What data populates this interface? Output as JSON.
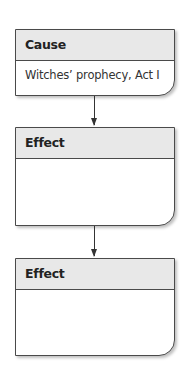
{
  "diagram": {
    "type": "cause-effect flowchart",
    "boxes": [
      {
        "header": "Cause",
        "body": "Witches’ prophecy, Act I"
      },
      {
        "header": "Effect",
        "body": ""
      },
      {
        "header": "Effect",
        "body": ""
      }
    ],
    "connectors": [
      {
        "from": 0,
        "to": 1,
        "style": "arrow-down"
      },
      {
        "from": 1,
        "to": 2,
        "style": "arrow-down"
      }
    ],
    "colors": {
      "header_fill": "#e8e8e8",
      "border": "#4a4a4a",
      "arrow": "#333333"
    }
  }
}
